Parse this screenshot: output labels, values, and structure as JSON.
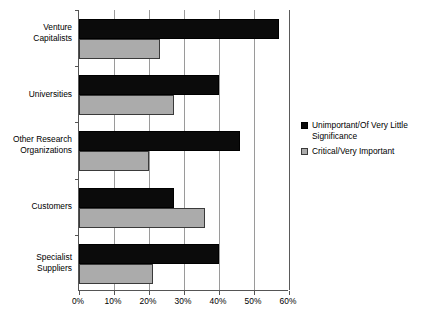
{
  "chart_data": {
    "type": "bar",
    "orientation": "horizontal",
    "title": "",
    "subtitle": "",
    "xlabel": "",
    "ylabel": "",
    "xlim": [
      0,
      60
    ],
    "xticks": [
      "0%",
      "10%",
      "20%",
      "30%",
      "40%",
      "50%",
      "60%"
    ],
    "xtick_values": [
      0,
      10,
      20,
      30,
      40,
      50,
      60
    ],
    "grid": true,
    "grid_axis": "x",
    "legend_position": "right",
    "categories": [
      "Venture Capitalists",
      "Universities",
      "Other Research Organizations",
      "Customers",
      "Specialist Suppliers"
    ],
    "category_lines": [
      [
        "Venture",
        "Capitalists"
      ],
      [
        "Universities"
      ],
      [
        "Other Research",
        "Organizations"
      ],
      [
        "Customers"
      ],
      [
        "Specialist",
        "Suppliers"
      ]
    ],
    "series": [
      {
        "name": "Unimportant/Of Very Little Significance",
        "color": "#0b0b0b",
        "values": [
          57,
          40,
          46,
          27,
          40
        ]
      },
      {
        "name": "Critical/Very Important",
        "color": "#ababab",
        "values": [
          23,
          27,
          20,
          36,
          21
        ]
      }
    ]
  },
  "legend": {
    "items": [
      {
        "label_line1": "Unimportant/Of Very Little",
        "label_line2": "Significance",
        "swatch": "dark"
      },
      {
        "label_line1": "Critical/Very Important",
        "label_line2": "",
        "swatch": "light"
      }
    ]
  },
  "colors": {
    "series_dark": "#0b0b0b",
    "series_light": "#ababab",
    "axis": "#555555",
    "gridline": "#9a9a9a",
    "background": "#ffffff"
  }
}
